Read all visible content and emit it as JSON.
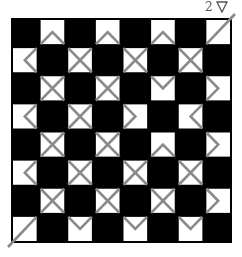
{
  "label": {
    "number": "2",
    "icon": "triangle-down-outline-icon"
  },
  "colors": {
    "dark": "#000000",
    "light": "#ffffff",
    "stroke": "#8a8a8a",
    "text": "#555555"
  },
  "grid": {
    "rows": 8,
    "cols": 8,
    "x": 11,
    "y": 18,
    "width": 221,
    "height": 225,
    "cells": [
      [
        "B",
        "N",
        "B",
        "N",
        "B",
        "N",
        "B",
        "D"
      ],
      [
        "L",
        "B",
        "X",
        "B",
        "X",
        "B",
        "X",
        "B"
      ],
      [
        "B",
        "X",
        "B",
        "X",
        "B",
        "V",
        "B",
        "R"
      ],
      [
        "L",
        "B",
        "X",
        "B",
        "R",
        "B",
        "L",
        "B"
      ],
      [
        "B",
        "X",
        "B",
        "X",
        "B",
        "N",
        "B",
        "R"
      ],
      [
        "L",
        "B",
        "X",
        "B",
        "X",
        "B",
        "X",
        "B"
      ],
      [
        "B",
        "X",
        "B",
        "X",
        "B",
        "X",
        "B",
        "R"
      ],
      [
        "D",
        "B",
        "V",
        "B",
        "V",
        "B",
        "V",
        "B"
      ]
    ],
    "legend": {
      "B": "black cell",
      "N": "white cell with up chevron (^) from bottom edge",
      "V": "white cell with down chevron (v) from top edge",
      "L": "white cell with left chevron (<)",
      "R": "white cell with right chevron (>)",
      "X": "white cell with X cross",
      "D": "white cell with diagonal / line"
    }
  }
}
